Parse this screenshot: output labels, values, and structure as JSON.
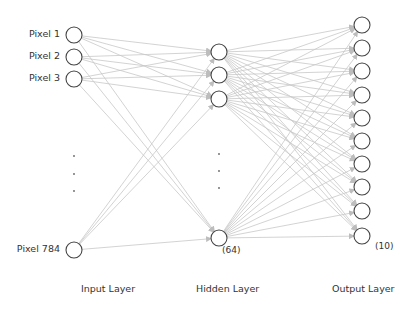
{
  "colors": {
    "node_stroke": "#444444",
    "edge": "#c8c8c8",
    "text": "#333333",
    "dot": "#666666"
  },
  "input_layer": {
    "label": "Input Layer",
    "nodes": [
      {
        "label": "Pixel 1",
        "x": 74,
        "y": 35
      },
      {
        "label": "Pixel 2",
        "x": 74,
        "y": 57
      },
      {
        "label": "Pixel 3",
        "x": 74,
        "y": 79
      },
      {
        "label": "Pixel 784",
        "x": 74,
        "y": 250
      }
    ],
    "ellipsis_dots": [
      {
        "x": 74,
        "y": 156
      },
      {
        "x": 74,
        "y": 174
      },
      {
        "x": 74,
        "y": 191
      }
    ]
  },
  "hidden_layer": {
    "label": "Hidden Layer",
    "count_label": "(64)",
    "nodes": [
      {
        "x": 219,
        "y": 52
      },
      {
        "x": 219,
        "y": 75
      },
      {
        "x": 219,
        "y": 99
      },
      {
        "x": 219,
        "y": 238
      }
    ],
    "ellipsis_dots": [
      {
        "x": 219,
        "y": 154
      },
      {
        "x": 219,
        "y": 171
      },
      {
        "x": 219,
        "y": 188
      }
    ]
  },
  "output_layer": {
    "label": "Output Layer",
    "count_label": "(10)",
    "nodes": [
      {
        "x": 362,
        "y": 25
      },
      {
        "x": 362,
        "y": 48
      },
      {
        "x": 362,
        "y": 71
      },
      {
        "x": 362,
        "y": 95
      },
      {
        "x": 362,
        "y": 118
      },
      {
        "x": 362,
        "y": 141
      },
      {
        "x": 362,
        "y": 164
      },
      {
        "x": 362,
        "y": 187
      },
      {
        "x": 362,
        "y": 211
      },
      {
        "x": 362,
        "y": 236
      }
    ]
  },
  "node_radius": 8
}
